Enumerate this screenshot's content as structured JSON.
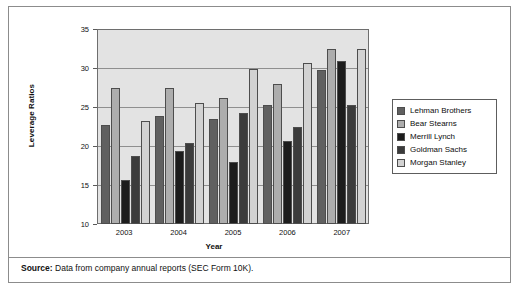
{
  "chart_data": {
    "type": "bar",
    "title": "",
    "xlabel": "Year",
    "ylabel": "Leverage Ratios",
    "ylim": [
      10,
      35
    ],
    "yticks": [
      10,
      15,
      20,
      25,
      30,
      35
    ],
    "grid": true,
    "legend_position": "right",
    "categories": [
      "2003",
      "2004",
      "2005",
      "2006",
      "2007"
    ],
    "series": [
      {
        "name": "Lehman Brothers",
        "color": "#606060",
        "values": [
          22.7,
          23.9,
          23.4,
          25.2,
          29.7
        ]
      },
      {
        "name": "Bear Stearns",
        "color": "#adadad",
        "values": [
          27.5,
          27.4,
          26.2,
          27.9,
          32.5
        ]
      },
      {
        "name": "Merrill Lynch",
        "color": "#1c1c1c",
        "values": [
          15.6,
          19.4,
          18.0,
          20.6,
          30.9
        ]
      },
      {
        "name": "Goldman Sachs",
        "color": "#3b3b3b",
        "values": [
          18.7,
          20.4,
          24.2,
          22.4,
          25.2
        ]
      },
      {
        "name": "Morgan Stanley",
        "color": "#d2d2d2",
        "values": [
          23.2,
          25.5,
          29.9,
          30.7,
          32.4
        ]
      }
    ],
    "plot_background": "#e3e3e3"
  },
  "source": {
    "label": "Source:",
    "text": " Data from company annual reports (SEC Form 10K)."
  }
}
